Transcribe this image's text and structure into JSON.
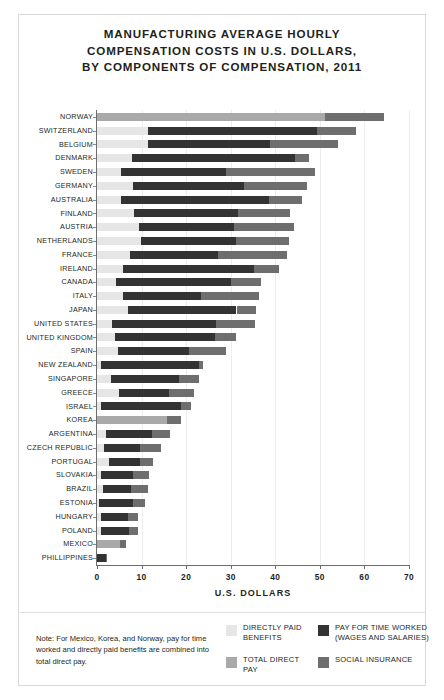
{
  "title": {
    "line1": "MANUFACTURING AVERAGE HOURLY",
    "line2": "COMPENSATION COSTS IN U.S. DOLLARS,",
    "line3": "BY COMPONENTS OF COMPENSATION, 2011"
  },
  "note": "Note: For Mexico, Korea, and Norway, pay for time worked and directly paid benefits are combined into total direct pay.",
  "legend": {
    "items": [
      {
        "label": "DIRECTLY PAID BENEFITS",
        "key": "benefits",
        "color": "#e6e6e6",
        "column": 1
      },
      {
        "label": "TOTAL DIRECT PAY",
        "key": "direct",
        "color": "#a9a9a9",
        "column": 1
      },
      {
        "label": "PAY FOR TIME WORKED (WAGES AND SALARIES)",
        "key": "wages",
        "color": "#333333",
        "column": 2
      },
      {
        "label": "SOCIAL INSURANCE",
        "key": "social",
        "color": "#6e6e6e",
        "column": 2
      }
    ]
  },
  "chart_data": {
    "type": "bar",
    "orientation": "horizontal",
    "stacked": true,
    "title": "MANUFACTURING AVERAGE HOURLY COMPENSATION COSTS IN U.S. DOLLARS, BY COMPONENTS OF COMPENSATION, 2011",
    "xlabel": "U.S. DOLLARS",
    "ylabel": "",
    "xlim": [
      0,
      70
    ],
    "xticks": [
      0,
      10,
      20,
      30,
      40,
      50,
      60,
      70
    ],
    "grid": "vertical",
    "legend_position": "bottom-right",
    "series": [
      {
        "name": "DIRECTLY PAID BENEFITS",
        "key": "benefits",
        "color": "#e6e6e6"
      },
      {
        "name": "PAY FOR TIME WORKED (WAGES AND SALARIES)",
        "key": "wages",
        "color": "#333333"
      },
      {
        "name": "SOCIAL INSURANCE",
        "key": "social",
        "color": "#6e6e6e"
      },
      {
        "name": "TOTAL DIRECT PAY",
        "key": "direct",
        "color": "#a9a9a9"
      }
    ],
    "categories": [
      "NORWAY",
      "SWITZERLAND",
      "BELGIUM",
      "DENMARK",
      "SWEDEN",
      "GERMANY",
      "AUSTRALIA",
      "FINLAND",
      "AUSTRIA",
      "NETHERLANDS",
      "FRANCE",
      "IRELAND",
      "CANADA",
      "ITALY",
      "JAPAN",
      "UNITED STATES",
      "UNITED KINGDOM",
      "SPAIN",
      "NEW ZEALAND",
      "SINGAPORE",
      "GREECE",
      "ISRAEL",
      "KOREA",
      "ARGENTINA",
      "CZECH REPUBLIC",
      "PORTUGAL",
      "SLOVAKIA",
      "BRAZIL",
      "ESTONIA",
      "HUNGARY",
      "POLAND",
      "MEXICO",
      "PHILLIPPINES"
    ],
    "rows": [
      {
        "category": "NORWAY",
        "benefits": 0.0,
        "wages": 0.0,
        "direct": 51.2,
        "social": 13.2,
        "total": 64.4
      },
      {
        "category": "SWITZERLAND",
        "benefits": 11.4,
        "wages": 38.0,
        "direct": 0.0,
        "social": 8.8,
        "total": 58.2
      },
      {
        "category": "BELGIUM",
        "benefits": 11.4,
        "wages": 27.4,
        "direct": 0.0,
        "social": 15.2,
        "total": 54.0
      },
      {
        "category": "DENMARK",
        "benefits": 7.9,
        "wages": 36.6,
        "direct": 0.0,
        "social": 3.0,
        "total": 47.5
      },
      {
        "category": "SWEDEN",
        "benefits": 5.4,
        "wages": 23.5,
        "direct": 0.0,
        "social": 20.1,
        "total": 49.0
      },
      {
        "category": "GERMANY",
        "benefits": 8.0,
        "wages": 24.9,
        "direct": 0.0,
        "social": 14.2,
        "total": 47.1
      },
      {
        "category": "AUSTRALIA",
        "benefits": 5.3,
        "wages": 33.4,
        "direct": 0.0,
        "social": 7.3,
        "total": 46.0
      },
      {
        "category": "FINLAND",
        "benefits": 8.3,
        "wages": 23.4,
        "direct": 0.0,
        "social": 11.7,
        "total": 43.4
      },
      {
        "category": "AUSTRIA",
        "benefits": 9.5,
        "wages": 21.3,
        "direct": 0.0,
        "social": 13.4,
        "total": 44.2
      },
      {
        "category": "NETHERLANDS",
        "benefits": 9.8,
        "wages": 21.3,
        "direct": 0.0,
        "social": 11.9,
        "total": 43.0
      },
      {
        "category": "FRANCE",
        "benefits": 7.3,
        "wages": 19.8,
        "direct": 0.0,
        "social": 15.6,
        "total": 42.7
      },
      {
        "category": "IRELAND",
        "benefits": 5.9,
        "wages": 29.3,
        "direct": 0.0,
        "social": 5.6,
        "total": 40.8
      },
      {
        "category": "CANADA",
        "benefits": 4.2,
        "wages": 25.9,
        "direct": 0.0,
        "social": 6.6,
        "total": 36.7
      },
      {
        "category": "ITALY",
        "benefits": 5.9,
        "wages": 17.4,
        "direct": 0.0,
        "social": 13.0,
        "total": 36.3
      },
      {
        "category": "JAPAN",
        "benefits": 7.0,
        "wages": 24.3,
        "direct": 0.0,
        "social": 4.3,
        "total": 35.6
      },
      {
        "category": "UNITED STATES",
        "benefits": 3.3,
        "wages": 23.3,
        "direct": 0.0,
        "social": 8.9,
        "total": 35.5
      },
      {
        "category": "UNITED KINGDOM",
        "benefits": 4.0,
        "wages": 22.4,
        "direct": 0.0,
        "social": 4.9,
        "total": 31.3
      },
      {
        "category": "SPAIN",
        "benefits": 4.8,
        "wages": 15.9,
        "direct": 0.0,
        "social": 8.3,
        "total": 29.0
      },
      {
        "category": "NEW ZEALAND",
        "benefits": 1.0,
        "wages": 21.9,
        "direct": 0.0,
        "social": 0.9,
        "total": 23.8
      },
      {
        "category": "SINGAPORE",
        "benefits": 3.2,
        "wages": 15.3,
        "direct": 0.0,
        "social": 4.3,
        "total": 22.8
      },
      {
        "category": "GREECE",
        "benefits": 5.0,
        "wages": 11.2,
        "direct": 0.0,
        "social": 5.6,
        "total": 21.8
      },
      {
        "category": "ISRAEL",
        "benefits": 0.9,
        "wages": 17.9,
        "direct": 0.0,
        "social": 2.4,
        "total": 21.2
      },
      {
        "category": "KOREA",
        "benefits": 0.0,
        "wages": 0.0,
        "direct": 15.8,
        "social": 3.0,
        "total": 18.8
      },
      {
        "category": "ARGENTINA",
        "benefits": 2.0,
        "wages": 10.4,
        "direct": 0.0,
        "social": 4.0,
        "total": 16.4
      },
      {
        "category": "CZECH REPUBLIC",
        "benefits": 1.5,
        "wages": 8.2,
        "direct": 0.0,
        "social": 4.6,
        "total": 14.3
      },
      {
        "category": "PORTUGAL",
        "benefits": 2.6,
        "wages": 7.1,
        "direct": 0.0,
        "social": 2.8,
        "total": 12.5
      },
      {
        "category": "SLOVAKIA",
        "benefits": 0.8,
        "wages": 7.3,
        "direct": 0.0,
        "social": 3.6,
        "total": 11.7
      },
      {
        "category": "BRAZIL",
        "benefits": 1.4,
        "wages": 6.2,
        "direct": 0.0,
        "social": 3.9,
        "total": 11.5
      },
      {
        "category": "ESTONIA",
        "benefits": 0.5,
        "wages": 7.6,
        "direct": 0.0,
        "social": 2.7,
        "total": 10.8
      },
      {
        "category": "HUNGARY",
        "benefits": 1.0,
        "wages": 5.9,
        "direct": 0.0,
        "social": 2.3,
        "total": 9.2
      },
      {
        "category": "POLAND",
        "benefits": 1.0,
        "wages": 6.2,
        "direct": 0.0,
        "social": 1.9,
        "total": 9.1
      },
      {
        "category": "MEXICO",
        "benefits": 0.0,
        "wages": 0.0,
        "direct": 5.2,
        "social": 1.3,
        "total": 6.5
      },
      {
        "category": "PHILLIPPINES",
        "benefits": 0.0,
        "wages": 2.0,
        "direct": 0.0,
        "social": 0.2,
        "total": 2.2
      }
    ]
  }
}
